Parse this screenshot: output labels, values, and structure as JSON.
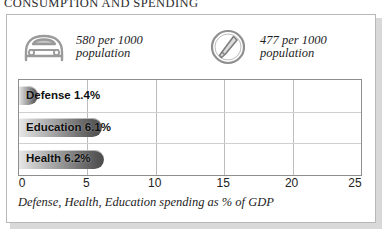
{
  "section": {
    "title": "CONSUMPTION AND SPENDING"
  },
  "stats": [
    {
      "icon": "car-icon",
      "value": "580 per 1000",
      "unit": "population",
      "text": "580 per 1000\npopulation"
    },
    {
      "icon": "mobile-phone-circle-icon",
      "value": "477 per 1000",
      "unit": "population",
      "text": "477 per 1000\npopulation"
    }
  ],
  "chart_data": {
    "type": "bar",
    "orientation": "horizontal",
    "title": "",
    "categories": [
      "Defense",
      "Education",
      "Health"
    ],
    "values": [
      1.4,
      6.1,
      6.2
    ],
    "value_labels": [
      "1.4%",
      "6.1%",
      "6.2%"
    ],
    "bar_labels": [
      "Defense 1.4%",
      "Education 6.1%",
      "Health 6.2%"
    ],
    "xlabel": "",
    "ylabel": "",
    "xlim": [
      0,
      25
    ],
    "xticks": [
      0,
      5,
      10,
      15,
      20,
      25
    ],
    "xtick_labels": [
      "0",
      "5",
      "10",
      "15",
      "20",
      "25"
    ],
    "grid": true,
    "legend": false,
    "caption": "Defense, Health, Education spending as % of GDP",
    "colors": {
      "bar_light": "#e8e8e8",
      "bar_dark": "#4a4a4a",
      "grid": "#bdbdbd",
      "border": "#8e8e8e",
      "text": "#0f0f0f"
    }
  },
  "caption": "Defense, Health, Education spending as % of GDP"
}
